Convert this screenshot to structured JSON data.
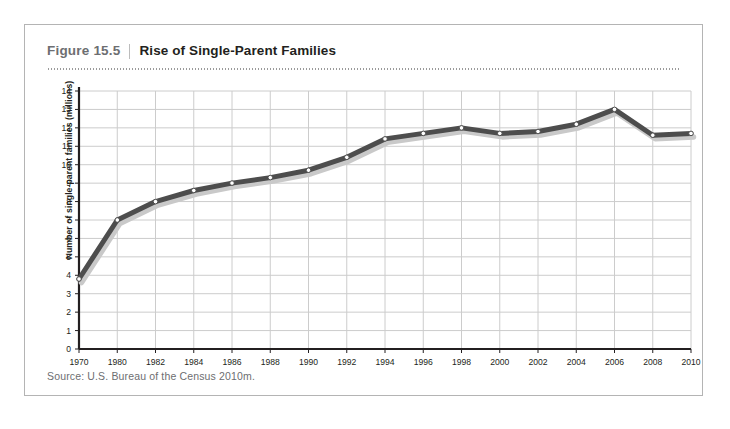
{
  "figure": {
    "number": "Figure 15.5",
    "title": "Rise of Single-Parent Families",
    "source": "Source: U.S. Bureau of the Census 2010m."
  },
  "colors": {
    "line": "#4d4d4d",
    "shadow": "#c9c9c9",
    "marker_fill": "#ffffff",
    "marker_stroke": "#4d4d4d",
    "grid": "#cccccc",
    "axis": "#231f20",
    "frame_border": "#b4b4b4",
    "fig_number": "#6d6e71",
    "fig_title": "#231f20",
    "source_text": "#6d6e71"
  },
  "chart_data": {
    "type": "line",
    "title": "Rise of Single-Parent Families",
    "xlabel": "",
    "ylabel": "Number of single-parent families (millions)",
    "ylim": [
      0,
      14
    ],
    "ytick_step": 1,
    "grid": true,
    "legend": "none",
    "categories": [
      "1970",
      "1980",
      "1982",
      "1984",
      "1986",
      "1988",
      "1990",
      "1992",
      "1994",
      "1996",
      "1998",
      "2000",
      "2002",
      "2004",
      "2006",
      "2008",
      "2010"
    ],
    "x": [
      1970,
      1980,
      1982,
      1984,
      1986,
      1988,
      1990,
      1992,
      1994,
      1996,
      1998,
      2000,
      2002,
      2004,
      2006,
      2008,
      2010
    ],
    "values": [
      3.8,
      7.0,
      8.0,
      8.6,
      9.0,
      9.3,
      9.7,
      10.4,
      11.4,
      11.7,
      12.0,
      11.7,
      11.8,
      12.2,
      13.0,
      11.6,
      11.7
    ],
    "yticks": [
      0,
      1,
      2,
      3,
      4,
      5,
      6,
      7,
      8,
      9,
      10,
      11,
      12,
      13,
      14
    ],
    "xticks": [
      1970,
      1980,
      1982,
      1984,
      1986,
      1988,
      1990,
      1992,
      1994,
      1996,
      1998,
      2000,
      2002,
      2004,
      2006,
      2008,
      2010
    ]
  }
}
